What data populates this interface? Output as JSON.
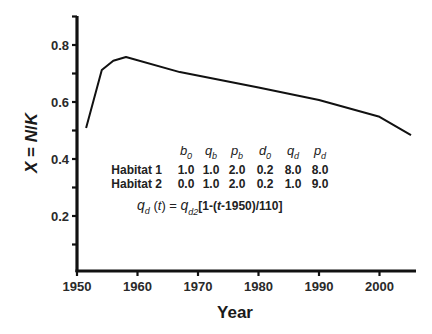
{
  "chart_data": {
    "type": "line",
    "title": "",
    "xlabel": "Year",
    "ylabel": "X = N/K",
    "xlim": [
      1950,
      2006
    ],
    "ylim": [
      0.0,
      0.9
    ],
    "x_ticks": [
      1950,
      1960,
      1970,
      1980,
      1990,
      2000
    ],
    "y_ticks": [
      0.2,
      0.4,
      0.6,
      0.8
    ],
    "y_tick_labels": [
      "0.2",
      "0.4",
      "0.6",
      "0.8"
    ],
    "y_minor_ticks": [
      0.1,
      0.3,
      0.5,
      0.7,
      0.9
    ],
    "grid": false,
    "series": [
      {
        "name": "X",
        "x": [
          1951.5,
          1954.1,
          1956.0,
          1958.1,
          1967.0,
          1980.0,
          1990.0,
          2000.0,
          2005.2
        ],
        "y": [
          0.509,
          0.712,
          0.745,
          0.758,
          0.705,
          0.651,
          0.607,
          0.548,
          0.484
        ]
      }
    ],
    "annotations": {
      "param_headers": [
        {
          "base": "b",
          "sub": "0"
        },
        {
          "base": "q",
          "sub": "b"
        },
        {
          "base": "p",
          "sub": "b"
        },
        {
          "base": "d",
          "sub": "0"
        },
        {
          "base": "q",
          "sub": "d"
        },
        {
          "base": "p",
          "sub": "d"
        }
      ],
      "rows": [
        {
          "label": "Habitat 1",
          "values": [
            "1.0",
            "1.0",
            "2.0",
            "0.2",
            "8.0",
            "8.0"
          ]
        },
        {
          "label": "Habitat 2",
          "values": [
            "0.0",
            "1.0",
            "2.0",
            "0.2",
            "1.0",
            "9.0"
          ]
        }
      ],
      "formula": {
        "lhs_base": "q",
        "lhs_sub": "d",
        "lhs_arg": " (t) = ",
        "rhs_base": "q",
        "rhs_sub": "d2",
        "rhs_rest_a": "[1-(",
        "rhs_t": "t",
        "rhs_rest_b": "-1950)/110]"
      }
    }
  }
}
